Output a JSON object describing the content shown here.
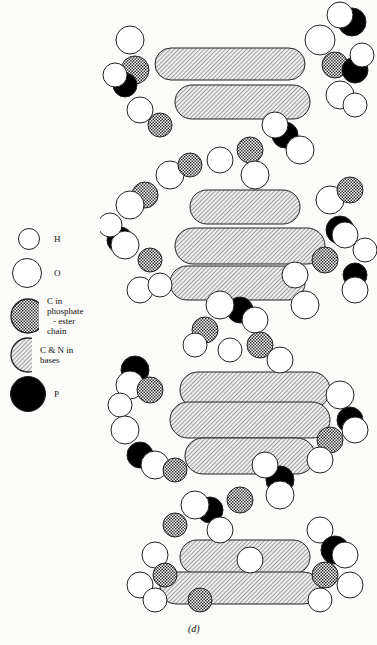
{
  "figure": {
    "caption": "(d)"
  },
  "legend": {
    "items": [
      {
        "symbol": "white-small-circle",
        "label": "H",
        "fill": "#ffffff"
      },
      {
        "symbol": "white-large-circle",
        "label": "O",
        "fill": "#ffffff"
      },
      {
        "symbol": "crosshatched-circle",
        "label": "C in phosphate",
        "label2": "- ester chain",
        "fill": "crosshatch"
      },
      {
        "symbol": "diagonal-hatched-circle",
        "label": "C & N in bases",
        "fill": "diagonal-hatch"
      },
      {
        "symbol": "black-circle",
        "label": "P",
        "fill": "#000000"
      }
    ]
  },
  "colors": {
    "background": "#fbfbf9",
    "ink": "#111111",
    "hatch": "#555555"
  }
}
